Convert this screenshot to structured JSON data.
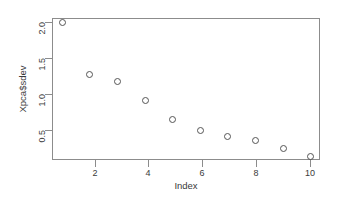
{
  "chart_data": {
    "type": "scatter",
    "title": "",
    "xlabel": "Index",
    "ylabel": "Xpca$sdev",
    "x": [
      1,
      2,
      3,
      4,
      5,
      6,
      7,
      8,
      9,
      10
    ],
    "values": [
      1.93,
      1.31,
      1.23,
      1.01,
      0.78,
      0.65,
      0.58,
      0.53,
      0.43,
      0.34
    ],
    "series": [
      {
        "name": "Xpca$sdev",
        "values": [
          1.93,
          1.31,
          1.23,
          1.01,
          0.78,
          0.65,
          0.58,
          0.53,
          0.43,
          0.34
        ]
      }
    ],
    "xlim": [
      0.64,
      10.36
    ],
    "ylim": [
      0.29,
      1.98
    ],
    "xticks": [
      "2",
      "4",
      "6",
      "8",
      "10"
    ],
    "xtick_values": [
      2,
      4,
      6,
      8,
      10
    ],
    "yticks": [
      "0.5",
      "1.0",
      "1.5",
      "2.0"
    ],
    "ytick_values": [
      0.5,
      1.0,
      1.5,
      2.0
    ],
    "grid": false,
    "legend": null,
    "marker": "open-circle",
    "marker_color": "#555555",
    "axis_color": "#8c8c8c",
    "background": "#ffffff"
  }
}
